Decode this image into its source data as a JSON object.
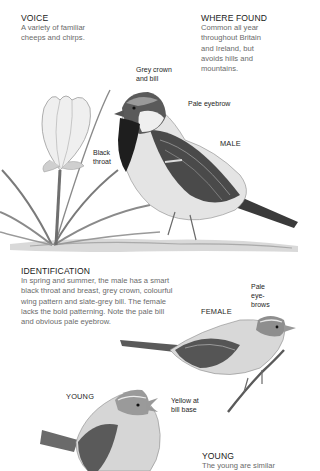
{
  "voice": {
    "heading": "VOICE",
    "lines": [
      "A variety of familiar",
      "cheeps and chirps."
    ]
  },
  "where_found": {
    "heading": "WHERE FOUND",
    "lines": [
      "Common all year",
      "throughout Britain",
      "and Ireland, but",
      "avoids hills and",
      "mountains."
    ]
  },
  "male_illustration": {
    "caption": "MALE",
    "annotations": {
      "crown": [
        "Grey crown",
        "and bill"
      ],
      "eyebrow": "Pale eyebrow",
      "throat": [
        "Black",
        "throat"
      ]
    }
  },
  "identification": {
    "heading": "IDENTIFICATION",
    "lines": [
      "In spring and summer, the male has a smart",
      "black throat and breast, grey crown, colourful",
      "wing pattern and slate-grey bill. The female",
      "lacks the bold patterning. Note the pale bill",
      "and obvious pale eyebrow."
    ]
  },
  "female_illustration": {
    "caption": "FEMALE",
    "annotations": {
      "eyebrows": [
        "Pale",
        "eye-",
        "brows"
      ]
    }
  },
  "young_illustration": {
    "caption": "YOUNG",
    "annotations": {
      "bill": [
        "Yellow at",
        "bill base"
      ]
    }
  },
  "young_section": {
    "heading": "YOUNG",
    "lines": [
      "The young are similar"
    ]
  },
  "colors": {
    "background": "#ffffff",
    "heading_text": "#1a1a1a",
    "body_text": "#6a6a6a"
  }
}
